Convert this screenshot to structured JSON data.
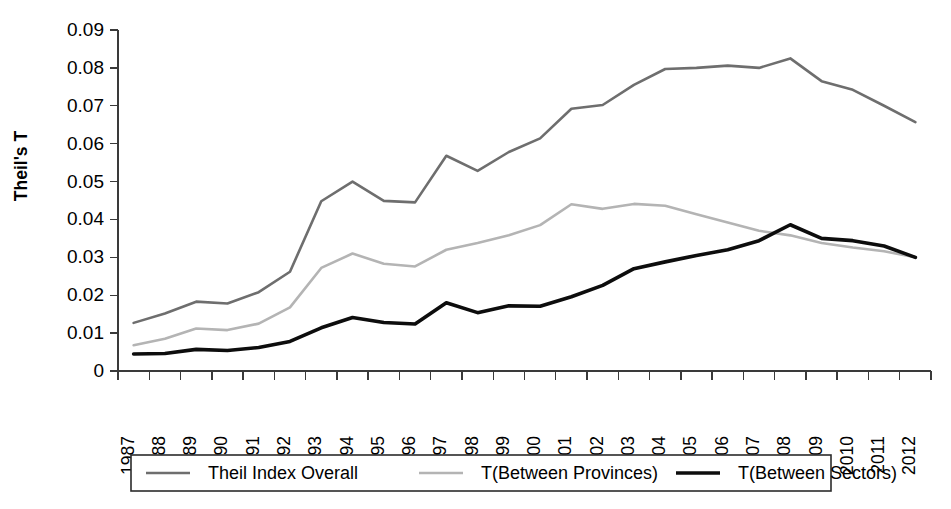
{
  "chart_data": {
    "type": "line",
    "title": "",
    "xlabel": "",
    "ylabel": "Theil's T",
    "ylim": [
      0,
      0.09
    ],
    "ytick_step": 0.01,
    "ytick_labels": [
      "0",
      "0.01",
      "0.02",
      "0.03",
      "0.04",
      "0.05",
      "0.06",
      "0.07",
      "0.08",
      "0.09"
    ],
    "grid": false,
    "legend_position": "bottom",
    "categories": [
      "1987",
      "1988",
      "1989",
      "1990",
      "1991",
      "1992",
      "1993",
      "1994",
      "1995",
      "1996",
      "1997",
      "1998",
      "1999",
      "2000",
      "2001",
      "2002",
      "2003",
      "2004",
      "2005",
      "2006",
      "2007",
      "2008",
      "2009",
      "2010",
      "2011",
      "2012"
    ],
    "series": [
      {
        "name": "Theil Index Overall",
        "color": "#6e6e6e",
        "width": 2.6,
        "values": [
          0.0127,
          0.0152,
          0.0183,
          0.0178,
          0.0208,
          0.0262,
          0.0448,
          0.05,
          0.0449,
          0.0445,
          0.0568,
          0.0528,
          0.0578,
          0.0614,
          0.0692,
          0.0702,
          0.0755,
          0.0797,
          0.08,
          0.0806,
          0.08,
          0.0825,
          0.0765,
          0.0742,
          0.07,
          0.0657
        ]
      },
      {
        "name": "T(Between Provinces)",
        "color": "#b4b4b4",
        "width": 2.6,
        "values": [
          0.0068,
          0.0085,
          0.0112,
          0.0108,
          0.0125,
          0.0168,
          0.0272,
          0.031,
          0.0283,
          0.0276,
          0.032,
          0.0338,
          0.0358,
          0.0385,
          0.044,
          0.0428,
          0.0441,
          0.0436,
          0.0414,
          0.0392,
          0.037,
          0.0358,
          0.0338,
          0.0326,
          0.0316,
          0.03
        ]
      },
      {
        "name": "T(Between Sectors)",
        "color": "#0d0d0d",
        "width": 3.6,
        "values": [
          0.0045,
          0.0046,
          0.0057,
          0.0054,
          0.0062,
          0.0078,
          0.0114,
          0.0141,
          0.0128,
          0.0124,
          0.018,
          0.0154,
          0.0172,
          0.0171,
          0.0196,
          0.0226,
          0.027,
          0.0288,
          0.0305,
          0.032,
          0.0344,
          0.0386,
          0.035,
          0.0344,
          0.033,
          0.03
        ]
      }
    ]
  },
  "legend": {
    "entries": [
      {
        "label": "Theil Index Overall"
      },
      {
        "label": "T(Between Provinces)"
      },
      {
        "label": "T(Between Sectors)"
      }
    ]
  }
}
